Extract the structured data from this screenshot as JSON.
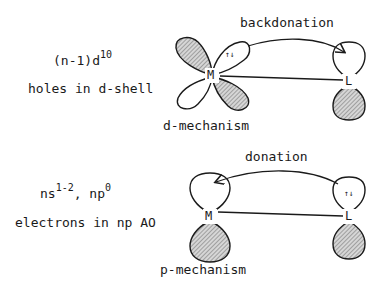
{
  "top": {
    "config_label": "(n-1)d",
    "config_sup": "10",
    "description": "holes in d-shell",
    "arrow_label": "backdonation",
    "caption": "d-mechanism",
    "metal_label": "M",
    "ligand_label": "L",
    "electron_pair": "↑↓"
  },
  "bottom": {
    "config_label_1": "ns",
    "config_sup_1": "1-2",
    "config_sep": ", np",
    "config_sup_2": "0",
    "description": "electrons in np AO",
    "arrow_label": "donation",
    "caption": "p-mechanism",
    "metal_label": "M",
    "ligand_label": "L",
    "electron_pair": "↑↓"
  },
  "colors": {
    "line": "#1a1a1a",
    "hatch": "#9a9a9a",
    "background": "#ffffff"
  }
}
